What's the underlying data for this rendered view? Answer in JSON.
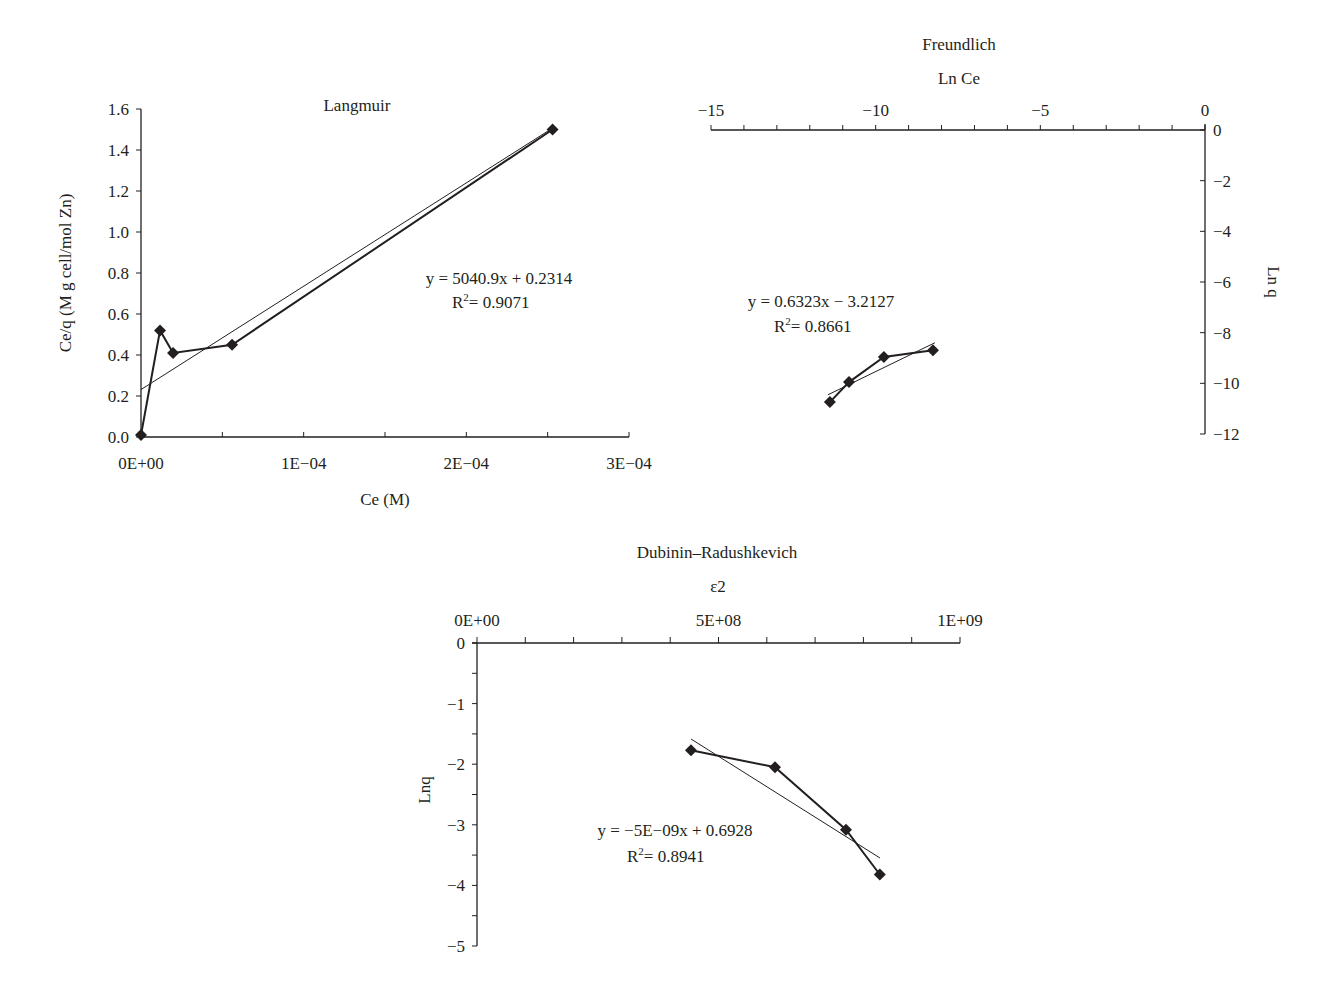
{
  "chart_data": [
    {
      "type": "scatter",
      "title": "Langmuir",
      "xlabel": "Ce (M)",
      "ylabel": "Ce/q (M g cell/mol Zn)",
      "xlim": [
        0,
        0.0003
      ],
      "ylim": [
        0,
        1.6
      ],
      "x_ticks": [
        "0E+00",
        "1E−04",
        "2E−04",
        "3E−04"
      ],
      "y_ticks": [
        "0.0",
        "0.2",
        "0.4",
        "0.6",
        "0.8",
        "1.0",
        "1.2",
        "1.4",
        "1.6"
      ],
      "grid": false,
      "series": [
        {
          "name": "data",
          "marker": "diamond",
          "connected": true,
          "x": [
            0.0,
            1.17e-05,
            1.97e-05,
            5.6e-05,
            0.000253
          ],
          "y": [
            0.01,
            0.52,
            0.41,
            0.45,
            1.5
          ]
        }
      ],
      "trendline": {
        "slope": 5040.9,
        "intercept": 0.2314,
        "r2": 0.9071,
        "equation": "y = 5040.9x + 0.2314",
        "r2_label": "= 0.9071"
      }
    },
    {
      "type": "scatter",
      "title": "Freundlich",
      "xlabel": "Ln Ce",
      "ylabel": "Ln q",
      "xlim": [
        -15,
        0
      ],
      "ylim": [
        -12,
        0
      ],
      "x_ticks": [
        "−15",
        "−10",
        "−5",
        "0"
      ],
      "y_ticks": [
        "0",
        "−2",
        "−4",
        "−6",
        "−8",
        "−10",
        "−12"
      ],
      "axis_position": {
        "x": "top",
        "y": "right"
      },
      "grid": false,
      "series": [
        {
          "name": "data",
          "marker": "diamond",
          "connected": true,
          "x": [
            -11.39,
            -10.81,
            -9.75,
            -8.26
          ],
          "y": [
            -10.74,
            -9.95,
            -8.96,
            -8.69
          ]
        }
      ],
      "trendline": {
        "slope": 0.6323,
        "intercept": -3.2127,
        "r2": 0.8661,
        "equation": "y = 0.6323x − 3.2127",
        "r2_label": "= 0.8661"
      }
    },
    {
      "type": "scatter",
      "title": "Dubinin–Radushkevich",
      "xlabel": "ε2",
      "ylabel": "Lnq",
      "xlim": [
        0,
        1000000000
      ],
      "ylim": [
        -5,
        0
      ],
      "x_ticks": [
        "0E+00",
        "5E+08",
        "1E+09"
      ],
      "y_ticks": [
        "0",
        "−1",
        "−2",
        "−3",
        "−4",
        "−5"
      ],
      "axis_position": {
        "x": "top",
        "y": "left"
      },
      "grid": false,
      "series": [
        {
          "name": "data",
          "marker": "diamond",
          "connected": true,
          "x": [
            443000000,
            617000000,
            764000000,
            834000000
          ],
          "y": [
            -1.77,
            -2.05,
            -3.08,
            -3.82
          ]
        }
      ],
      "trendline": {
        "slope": -5e-09,
        "intercept": 0.6928,
        "r2": 0.8941,
        "equation": "y = −5E−09x + 0.6928",
        "r2_label": "= 0.8941"
      }
    }
  ],
  "style": {
    "ink": "#231f20",
    "background": "#ffffff"
  }
}
